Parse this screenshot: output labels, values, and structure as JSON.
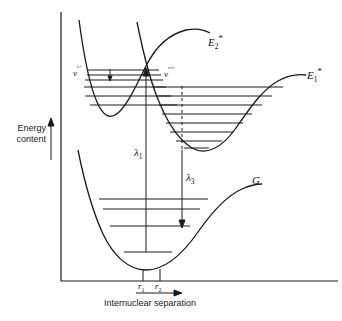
{
  "figure": {
    "type": "potential-energy-curve-diagram",
    "axes": {
      "y_label_line1": "Energy",
      "y_label_line2": "content",
      "x_label": "Internuclear  separation",
      "y_arrow": "up-arrow",
      "x_arrow": "right-arrow"
    },
    "curves": [
      {
        "id": "E2",
        "label": "E",
        "subscript": "2",
        "superscript": "*",
        "levels": 6,
        "note": "upper-left excited state well"
      },
      {
        "id": "E1",
        "label": "E",
        "subscript": "1",
        "superscript": "*",
        "levels": 8,
        "note": "right excited state well"
      },
      {
        "id": "G",
        "label": "G",
        "subscript": "",
        "superscript": "",
        "levels": 4,
        "note": "ground state well"
      }
    ],
    "vibrational_markers": [
      {
        "id": "v-double-prime",
        "base": "v",
        "primes": "′′",
        "x": 73,
        "y": 71
      },
      {
        "id": "v-triple-prime",
        "base": "v",
        "primes": "′′′",
        "x": 164,
        "y": 72
      }
    ],
    "transitions": [
      {
        "id": "lambda1",
        "label": "λ",
        "subscript": "1",
        "x": 140,
        "y": 152,
        "style": "solid",
        "direction": "up"
      },
      {
        "id": "lambda3",
        "label": "λ",
        "subscript": "3",
        "x": 189,
        "y": 177,
        "style": "dashed-then-solid",
        "direction": "down"
      }
    ],
    "tick_labels": [
      {
        "id": "r1",
        "base": "r",
        "subscript": "1",
        "x": 141,
        "y": 275
      },
      {
        "id": "r2",
        "base": "r",
        "subscript": "2",
        "x": 157,
        "y": 275
      }
    ],
    "colors": {
      "ink": "#1a1a1a",
      "background": "#ffffff"
    }
  }
}
